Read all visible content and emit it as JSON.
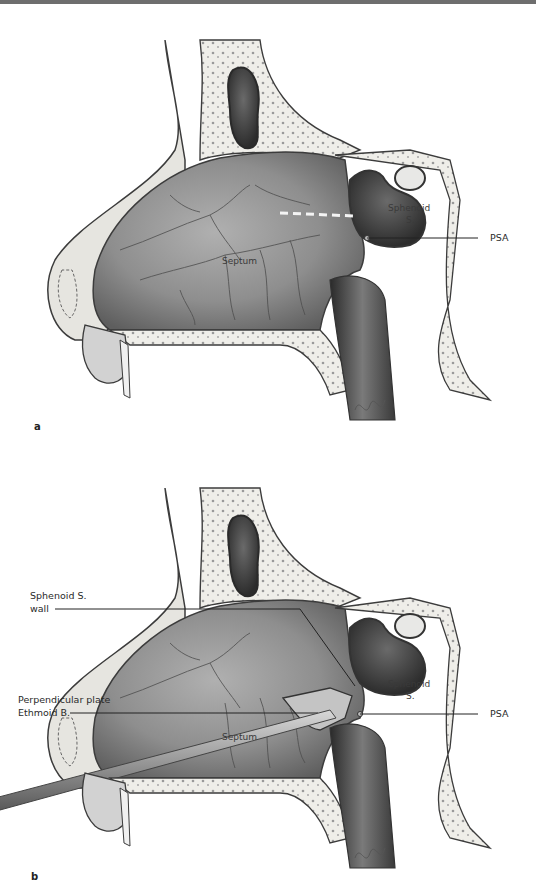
{
  "figure": {
    "panels": [
      {
        "letter": "a",
        "labels": {
          "septum": "Septum",
          "sphenoid_sinus_line1": "Sphenoid",
          "sphenoid_sinus_line2": "S.",
          "psa": "PSA"
        }
      },
      {
        "letter": "b",
        "labels": {
          "septum": "Septum",
          "sphenoid_sinus_line1": "Sphenoid",
          "sphenoid_sinus_line2": "S.",
          "psa": "PSA",
          "sphenoid_wall_line1": "Sphenoid S.",
          "sphenoid_wall_line2": "wall",
          "perp_plate_line1": "Perpendicular plate",
          "perp_plate_line2": "Ethmoid B."
        }
      }
    ],
    "colors": {
      "top_rule": "#6e6e6e",
      "cavity": "#8a8a8a",
      "bone": "#ecebe6",
      "outline": "#3c3c3c",
      "sinus_dark": "#4a4a4a"
    }
  }
}
